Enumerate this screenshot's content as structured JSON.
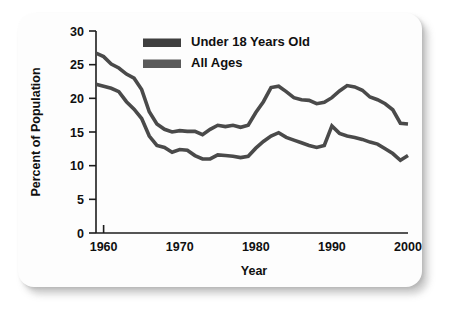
{
  "chart_data": {
    "type": "line",
    "title": "",
    "xlabel": "Year",
    "ylabel": "Percent of Population",
    "xlim": [
      1959,
      2000
    ],
    "ylim": [
      0,
      30
    ],
    "grid": false,
    "legend_position": "top-center",
    "x_ticks": [
      "1960",
      "1970",
      "1980",
      "1990",
      "2000"
    ],
    "x_tick_values": [
      1960,
      1970,
      1980,
      1990,
      2000
    ],
    "y_ticks": [
      "0",
      "5",
      "10",
      "15",
      "20",
      "25",
      "30"
    ],
    "y_tick_values": [
      0,
      5,
      10,
      15,
      20,
      25,
      30
    ],
    "x": [
      1959,
      1960,
      1961,
      1962,
      1963,
      1964,
      1965,
      1966,
      1967,
      1968,
      1969,
      1970,
      1971,
      1972,
      1973,
      1974,
      1975,
      1976,
      1977,
      1978,
      1979,
      1980,
      1981,
      1982,
      1983,
      1984,
      1985,
      1986,
      1987,
      1988,
      1989,
      1990,
      1991,
      1992,
      1993,
      1994,
      1995,
      1996,
      1997,
      1998,
      1999,
      2000
    ],
    "series": [
      {
        "name": "Under 18 Years Old",
        "color": "#4a4a4a",
        "width": 3.6,
        "values": [
          26.7,
          26.2,
          25.1,
          24.5,
          23.6,
          23.0,
          21.3,
          18.0,
          16.2,
          15.4,
          15.0,
          15.2,
          15.1,
          15.1,
          14.6,
          15.4,
          16.0,
          15.8,
          16.0,
          15.7,
          16.0,
          17.9,
          19.5,
          21.6,
          21.8,
          21.0,
          20.1,
          19.8,
          19.7,
          19.2,
          19.4,
          20.1,
          21.1,
          21.9,
          21.7,
          21.2,
          20.2,
          19.8,
          19.2,
          18.3,
          16.3,
          16.2
        ]
      },
      {
        "name": "All Ages",
        "color": "#4a4a4a",
        "width": 3.6,
        "values": [
          22.1,
          21.8,
          21.5,
          21.0,
          19.5,
          18.4,
          17.0,
          14.4,
          13.0,
          12.7,
          12.0,
          12.4,
          12.3,
          11.5,
          11.0,
          11.0,
          11.6,
          11.5,
          11.4,
          11.2,
          11.4,
          12.6,
          13.6,
          14.4,
          14.9,
          14.2,
          13.8,
          13.4,
          13.0,
          12.7,
          13.0,
          15.9,
          14.8,
          14.4,
          14.2,
          13.9,
          13.5,
          13.2,
          12.5,
          11.8,
          10.8,
          11.5
        ]
      }
    ],
    "legend": [
      {
        "label": "Under 18 Years Old",
        "color": "#3f3f3f"
      },
      {
        "label": "All Ages",
        "color": "#5a5a5a"
      }
    ]
  }
}
